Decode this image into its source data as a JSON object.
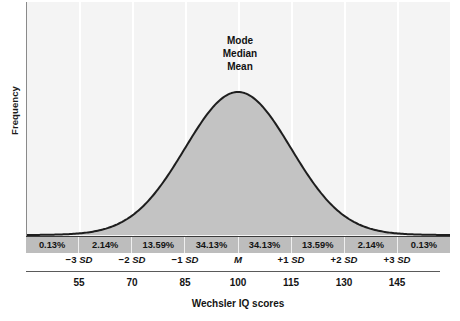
{
  "chart_data": {
    "type": "area",
    "title": "",
    "subtitle": "",
    "xlabel": "Wechsler IQ scores",
    "ylabel": "Frequency",
    "grid": true,
    "legend_position": "none",
    "distribution": "normal",
    "mean": 100,
    "sd": 15,
    "xlim": [
      40,
      160
    ],
    "x_tick_labels": [
      "55",
      "70",
      "85",
      "100",
      "115",
      "130",
      "145"
    ],
    "x_tick_values": [
      55,
      70,
      85,
      100,
      115,
      130,
      145
    ],
    "sd_tick_labels": [
      "-3 SD",
      "-2 SD",
      "-1 SD",
      "M",
      "+1 SD",
      "+2 SD",
      "+3 SD"
    ],
    "sd_tick_signs": [
      "−3 ",
      "−2 ",
      "−1 ",
      "",
      "+1 ",
      "+2 ",
      "+3 "
    ],
    "sd_tick_units": [
      "SD",
      "SD",
      "SD",
      "M",
      "SD",
      "SD",
      "SD"
    ],
    "sd_tick_values": [
      -3,
      -2,
      -1,
      0,
      1,
      2,
      3
    ],
    "band_categories": [
      "below −3 SD",
      "−3 SD to −2 SD",
      "−2 SD to −1 SD",
      "−1 SD to M",
      "M to +1 SD",
      "+1 SD to +2 SD",
      "+2 SD to +3 SD",
      "above +3 SD"
    ],
    "band_values": [
      0.13,
      2.14,
      13.59,
      34.13,
      34.13,
      13.59,
      2.14,
      0.13
    ],
    "band_labels": [
      "0.13%",
      "2.14%",
      "13.59%",
      "34.13%",
      "34.13%",
      "13.59%",
      "2.14%",
      "0.13%"
    ],
    "annotations": [
      "Mode",
      "Median",
      "Mean"
    ],
    "colors": {
      "plot_background": "#f4f4f4",
      "curve_fill": "#c3c3c3",
      "curve_stroke": "#1e1e1e",
      "band_background": "#bdbdbd",
      "gridline": "#ffffff",
      "axis": "#5a5a5a",
      "text": "#141414"
    }
  },
  "axes": {
    "y_title": "Frequency",
    "x_title": "Wechsler IQ scores"
  },
  "center_annotation": {
    "mode": "Mode",
    "median": "Median",
    "mean": "Mean"
  }
}
